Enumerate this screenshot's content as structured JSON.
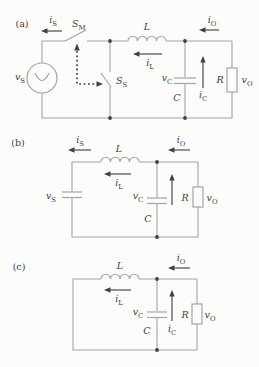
{
  "colors": {
    "wire": "#9ea7a3",
    "ink": "#3d4244",
    "background": "#fcfcfa"
  },
  "panels": {
    "a": {
      "tag": "(a)",
      "labels": {
        "i_s": {
          "base": "i",
          "sub": "S"
        },
        "s_m": {
          "base": "S",
          "sub": "M"
        },
        "l": {
          "base": "L",
          "sub": ""
        },
        "i_o": {
          "base": "i",
          "sub": "O"
        },
        "v_s": {
          "base": "v",
          "sub": "S"
        },
        "s_s": {
          "base": "S",
          "sub": "S"
        },
        "i_l": {
          "base": "i",
          "sub": "L"
        },
        "v_c": {
          "base": "v",
          "sub": "C"
        },
        "c": {
          "base": "C",
          "sub": ""
        },
        "i_c": {
          "base": "i",
          "sub": "C"
        },
        "r": {
          "base": "R",
          "sub": ""
        },
        "v_o": {
          "base": "v",
          "sub": "O"
        }
      }
    },
    "b": {
      "tag": "(b)",
      "labels": {
        "i_s": {
          "base": "i",
          "sub": "S"
        },
        "l": {
          "base": "L",
          "sub": ""
        },
        "i_o": {
          "base": "i",
          "sub": "O"
        },
        "v_s": {
          "base": "v",
          "sub": "S"
        },
        "i_l": {
          "base": "i",
          "sub": "L"
        },
        "v_c": {
          "base": "v",
          "sub": "C"
        },
        "c": {
          "base": "C",
          "sub": ""
        },
        "r": {
          "base": "R",
          "sub": ""
        },
        "v_o": {
          "base": "v",
          "sub": "O"
        }
      }
    },
    "c": {
      "tag": "(c)",
      "labels": {
        "l": {
          "base": "L",
          "sub": ""
        },
        "i_o": {
          "base": "i",
          "sub": "O"
        },
        "i_l": {
          "base": "i",
          "sub": "L"
        },
        "v_c": {
          "base": "v",
          "sub": "C"
        },
        "c": {
          "base": "C",
          "sub": ""
        },
        "i_c": {
          "base": "i",
          "sub": "C"
        },
        "r": {
          "base": "R",
          "sub": ""
        },
        "v_o": {
          "base": "v",
          "sub": "O"
        }
      }
    }
  }
}
